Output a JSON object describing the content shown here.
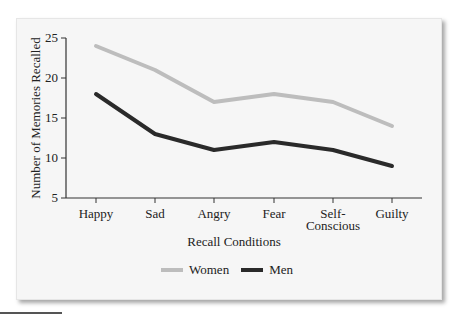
{
  "chart_data": {
    "type": "line",
    "title": "",
    "xlabel": "Recall Conditions",
    "ylabel": "Number of Memories Recalled",
    "categories": [
      "Happy",
      "Sad",
      "Angry",
      "Fear",
      "Self-Conscious",
      "Guilty"
    ],
    "category_lines": [
      [
        "Happy"
      ],
      [
        "Sad"
      ],
      [
        "Angry"
      ],
      [
        "Fear"
      ],
      [
        "Self-",
        "Conscious"
      ],
      [
        "Guilty"
      ]
    ],
    "yticks": [
      5,
      10,
      15,
      20,
      25
    ],
    "ylim": [
      5,
      25
    ],
    "grid": false,
    "legend_position": "bottom",
    "series": [
      {
        "name": "Women",
        "color": "#bdbdbd",
        "values": [
          24,
          21,
          17,
          18,
          17,
          14
        ]
      },
      {
        "name": "Men",
        "color": "#2a2a2a",
        "values": [
          18,
          13,
          11,
          12,
          11,
          9
        ]
      }
    ]
  },
  "legend": {
    "items": [
      {
        "label": "Women",
        "color": "#bdbdbd"
      },
      {
        "label": "Men",
        "color": "#2a2a2a"
      }
    ]
  },
  "colors": {
    "panel_bg": "#f6f6f6",
    "axis": "#333333"
  }
}
